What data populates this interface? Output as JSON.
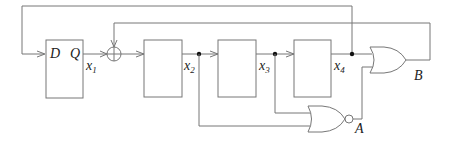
{
  "diagram": {
    "type": "shift-register-circuit",
    "flipflop": {
      "input_label": "D",
      "output_label": "Q"
    },
    "signals": {
      "x1": {
        "base": "x",
        "sub": "1"
      },
      "x2": {
        "base": "x",
        "sub": "2"
      },
      "x3": {
        "base": "x",
        "sub": "3"
      },
      "x4": {
        "base": "x",
        "sub": "4"
      }
    },
    "xor_symbol": "+",
    "gates": {
      "nor": {
        "output_label": "A"
      },
      "or": {
        "output_label": "B"
      }
    },
    "colors": {
      "wire": "#777777",
      "dot": "#111111",
      "text": "#222222"
    }
  }
}
